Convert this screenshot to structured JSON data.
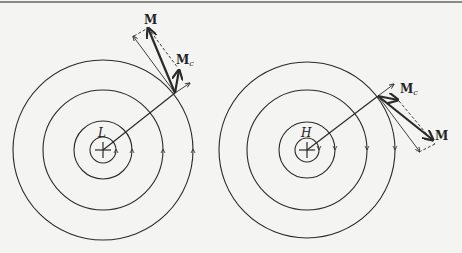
{
  "figure": {
    "top_rule": true,
    "panels": [
      {
        "id": "low",
        "center_label": "L",
        "center": [
          103,
          150
        ],
        "radii": [
          13,
          29,
          60,
          90
        ],
        "rotation": "counterclockwise",
        "point": [
          175,
          93
        ],
        "labels": {
          "M": "M",
          "Mc": "M",
          "Mc_sub": "c"
        }
      },
      {
        "id": "high",
        "center_label": "H",
        "center": [
          307,
          150
        ],
        "radii": [
          12,
          28,
          60,
          88
        ],
        "rotation": "clockwise",
        "point": [
          378,
          96
        ],
        "labels": {
          "M": "M",
          "Mc": "M",
          "Mc_sub": "c"
        }
      }
    ]
  },
  "colors": {
    "line": "#2a2a2a",
    "background": "#f4f4f2"
  }
}
